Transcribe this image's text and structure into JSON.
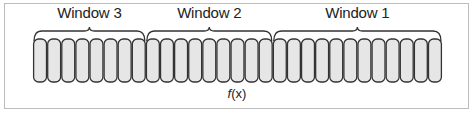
{
  "diagram": {
    "cell_count": 29,
    "cells": {
      "x_start": 33,
      "x_end": 442,
      "y_top": 39,
      "y_bottom": 82,
      "fill": "#e6e6e6",
      "stroke": "#333333"
    },
    "windows": [
      {
        "label": "Window 3",
        "start_cell": 0,
        "end_cell": 8,
        "label_x": 88
      },
      {
        "label": "Window 2",
        "start_cell": 8,
        "end_cell": 17,
        "label_x": 209
      },
      {
        "label": "Window 1",
        "start_cell": 17,
        "end_cell": 29,
        "label_x": 360
      }
    ],
    "function_label": {
      "italic": "f",
      "rest": "(x)"
    },
    "frame_border": "#bdbdbd"
  }
}
